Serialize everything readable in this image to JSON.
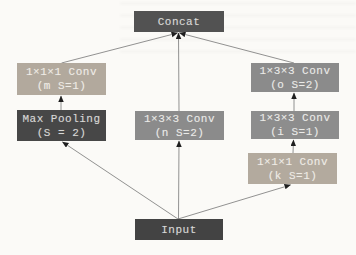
{
  "diagram": {
    "background_color": "#fbfaf7",
    "edge_color": "#767676",
    "arrowhead_color": "#1f1f1f",
    "nodes": {
      "concat": {
        "label": "Concat",
        "fill": "#525252"
      },
      "conv_m": {
        "label": "1×1×1 Conv",
        "param": "(m S=1)",
        "fill": "#b2a99d"
      },
      "max_pooling": {
        "label": "Max Pooling",
        "param": "(S = 2)",
        "fill": "#474747"
      },
      "conv_n": {
        "label": "1×3×3 Conv",
        "param": "(n S=2)",
        "fill": "#8b8b8b"
      },
      "conv_o": {
        "label": "1×3×3 Conv",
        "param": "(o S=2)",
        "fill": "#8b8b8b"
      },
      "conv_i": {
        "label": "1×3×3 Conv",
        "param": "(i S=1)",
        "fill": "#8d8d8d"
      },
      "conv_k": {
        "label": "1×1×1 Conv",
        "param": "(k S=1)",
        "fill": "#b3aa9e"
      },
      "input": {
        "label": "Input",
        "fill": "#434343"
      }
    },
    "edges": [
      {
        "from": "conv_m",
        "to": "concat"
      },
      {
        "from": "conv_n",
        "to": "concat"
      },
      {
        "from": "conv_o",
        "to": "concat"
      },
      {
        "from": "max_pooling",
        "to": "conv_m"
      },
      {
        "from": "conv_i",
        "to": "conv_o"
      },
      {
        "from": "conv_k",
        "to": "conv_i"
      },
      {
        "from": "input",
        "to": "max_pooling"
      },
      {
        "from": "input",
        "to": "conv_n"
      },
      {
        "from": "input",
        "to": "conv_k"
      }
    ]
  }
}
